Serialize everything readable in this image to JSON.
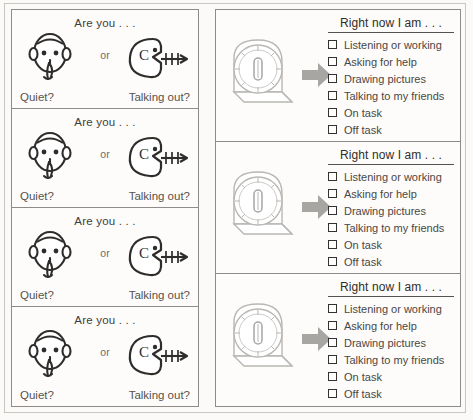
{
  "left_column": {
    "cards": [
      {
        "title": "Are you . . .",
        "connector": "or",
        "left_option_label": "Quiet?",
        "right_option_label": "Talking out?",
        "left_icon": "shushing-face-icon",
        "right_icon": "talking-out-face-icon"
      },
      {
        "title": "Are you . . .",
        "connector": "or",
        "left_option_label": "Quiet?",
        "right_option_label": "Talking out?",
        "left_icon": "shushing-face-icon",
        "right_icon": "talking-out-face-icon"
      },
      {
        "title": "Are you . . .",
        "connector": "or",
        "left_option_label": "Quiet?",
        "right_option_label": "Talking out?",
        "left_icon": "shushing-face-icon",
        "right_icon": "talking-out-face-icon"
      },
      {
        "title": "Are you . . .",
        "connector": "or",
        "left_option_label": "Quiet?",
        "right_option_label": "Talking out?",
        "left_icon": "shushing-face-icon",
        "right_icon": "talking-out-face-icon"
      }
    ]
  },
  "right_column": {
    "blocks": [
      {
        "title": "Right now I am . . .",
        "timer_icon": "kitchen-timer-icon",
        "arrow_icon": "arrow-right-icon",
        "items": [
          "Listening or working",
          "Asking for help",
          "Drawing pictures",
          "Talking to my friends",
          "On task",
          "Off task"
        ]
      },
      {
        "title": "Right now I am . . .",
        "timer_icon": "kitchen-timer-icon",
        "arrow_icon": "arrow-right-icon",
        "items": [
          "Listening or working",
          "Asking for help",
          "Drawing pictures",
          "Talking to my friends",
          "On task",
          "Off task"
        ]
      },
      {
        "title": "Right now I am . . .",
        "timer_icon": "kitchen-timer-icon",
        "arrow_icon": "arrow-right-icon",
        "items": [
          "Listening or working",
          "Asking for help",
          "Drawing pictures",
          "Talking to my friends",
          "On task",
          "Off task"
        ]
      }
    ]
  },
  "colors": {
    "page_background": "#fbfaf8",
    "card_background": "#fdfcfa",
    "border": "#8e8b88",
    "outer_frame": "#c9c6c2",
    "ink": "#2f2d2b",
    "label_text": "#55524f",
    "arrow_gray": "#a8a6a3",
    "timer_line": "#b9b7b4",
    "checkbox_outline": "#343230"
  }
}
